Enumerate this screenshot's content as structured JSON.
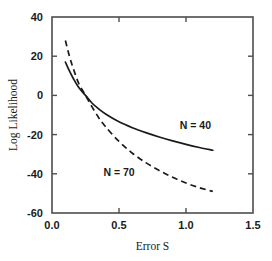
{
  "chart_data": {
    "type": "line",
    "title": "",
    "xlabel": "Error S",
    "ylabel": "Log Likelihood",
    "xlim": [
      0.0,
      1.5
    ],
    "ylim": [
      -60,
      40
    ],
    "xticks": [
      "0.0",
      "0.5",
      "1.0",
      "1.5"
    ],
    "xtick_values": [
      0.0,
      0.5,
      1.0,
      1.5
    ],
    "yticks": [
      "40",
      "20",
      "0",
      "-20",
      "-40",
      "-60"
    ],
    "ytick_values": [
      40,
      20,
      0,
      -20,
      -40,
      -60
    ],
    "grid": false,
    "legend": "inline-annotations",
    "series": [
      {
        "name": "N = 40",
        "style": "solid",
        "color": "#1a1a1a",
        "label_x": 1.07,
        "label_y": -17,
        "x": [
          0.1,
          0.13,
          0.16,
          0.2,
          0.25,
          0.3,
          0.35,
          0.4,
          0.5,
          0.6,
          0.7,
          0.8,
          0.9,
          1.0,
          1.1,
          1.2
        ],
        "y": [
          17.0,
          12.5,
          8.5,
          4.0,
          0.0,
          -4.0,
          -7.0,
          -9.5,
          -13.5,
          -16.5,
          -19.0,
          -21.2,
          -23.2,
          -25.0,
          -26.6,
          -28.0
        ]
      },
      {
        "name": "N = 70",
        "style": "dashed",
        "color": "#1a1a1a",
        "label_x": 0.5,
        "label_y": -41,
        "x": [
          0.1,
          0.13,
          0.16,
          0.2,
          0.25,
          0.3,
          0.35,
          0.4,
          0.5,
          0.6,
          0.7,
          0.8,
          0.9,
          1.0,
          1.1,
          1.2
        ],
        "y": [
          28.0,
          20.0,
          13.5,
          6.0,
          0.0,
          -6.0,
          -11.5,
          -16.0,
          -23.5,
          -29.5,
          -34.3,
          -38.3,
          -41.8,
          -44.7,
          -47.1,
          -49.0
        ]
      }
    ]
  },
  "axes": {
    "x_axis_name": "Error S",
    "y_axis_name": "Log Likelihood"
  }
}
